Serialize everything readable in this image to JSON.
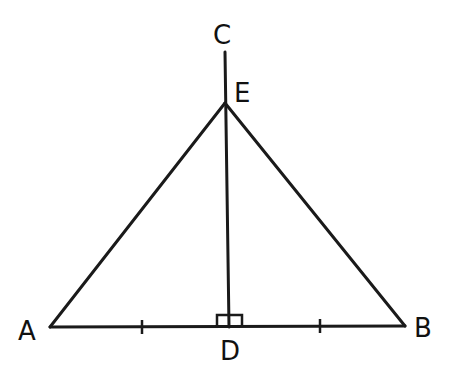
{
  "diagram": {
    "type": "geometry",
    "points": {
      "A": {
        "label": "A",
        "x": 50,
        "y": 327
      },
      "B": {
        "label": "B",
        "x": 405,
        "y": 326
      },
      "C": {
        "label": "C",
        "x": 225,
        "y": 52
      },
      "D": {
        "label": "D",
        "x": 229,
        "y": 327
      },
      "E": {
        "label": "E",
        "x": 225,
        "y": 103
      }
    },
    "segments": [
      "AB",
      "AE",
      "BE",
      "CD"
    ],
    "markings": {
      "right_angle_at": "D",
      "congruent_ticks": [
        "AD",
        "DB"
      ]
    },
    "colors": {
      "stroke": "#1a1a1a",
      "background": "#ffffff"
    }
  }
}
